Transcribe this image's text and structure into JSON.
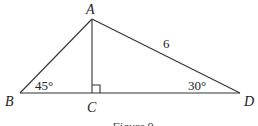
{
  "figure": {
    "caption": "Figure 9",
    "vertices": {
      "A": {
        "label": "A"
      },
      "B": {
        "label": "B"
      },
      "C": {
        "label": "C"
      },
      "D": {
        "label": "D"
      }
    },
    "side_labels": {
      "AD": "6"
    },
    "angle_labels": {
      "B": "45°",
      "D": "30°"
    },
    "right_angle_at": "C",
    "line_color": "#333333"
  }
}
